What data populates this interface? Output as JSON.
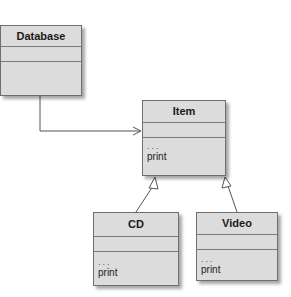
{
  "diagram": {
    "type": "uml-class-diagram",
    "classes": [
      {
        "id": "db",
        "name": "Database",
        "attributes": [],
        "operations": []
      },
      {
        "id": "item",
        "name": "Item",
        "attributes": [],
        "operations": [
          "...",
          "print"
        ]
      },
      {
        "id": "cd",
        "name": "CD",
        "attributes": [],
        "operations": [
          "...",
          "print"
        ]
      },
      {
        "id": "video",
        "name": "Video",
        "attributes": [],
        "operations": [
          "...",
          "print"
        ]
      }
    ],
    "relations": [
      {
        "from": "Database",
        "to": "Item",
        "kind": "association (navigable)"
      },
      {
        "from": "CD",
        "to": "Item",
        "kind": "generalization"
      },
      {
        "from": "Video",
        "to": "Item",
        "kind": "generalization"
      }
    ],
    "colors": {
      "box_fill": "#dcdcdc",
      "box_border": "#6f6f6f",
      "line": "#555555"
    }
  }
}
